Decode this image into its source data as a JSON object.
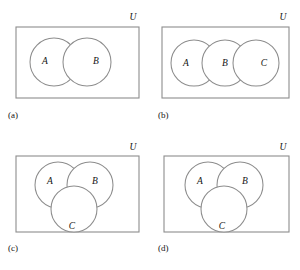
{
  "figure": {
    "background_color": "#ffffff",
    "stroke_color": "#8d8d8d",
    "shade_color": "#e7e5e3",
    "text_color": "#141414"
  },
  "panels": [
    {
      "id": "a",
      "caption": "(a)",
      "universe_label": "U",
      "layout": "two-circles",
      "sets": [
        "A",
        "B"
      ],
      "shaded_description": "A and B excluding their intersection (symmetric difference)",
      "labels": [
        {
          "text": "A",
          "x": 45,
          "y": 62
        },
        {
          "text": "B",
          "x": 96,
          "y": 62
        }
      ],
      "rect": {
        "x": 16,
        "y": 27,
        "width": 123,
        "height": 71
      },
      "circles": [
        {
          "set": "A",
          "cx": 54,
          "cy": 62,
          "r": 24
        },
        {
          "set": "B",
          "cx": 87,
          "cy": 62,
          "r": 24
        }
      ],
      "universe_label_pos": {
        "x": 133,
        "y": 18
      },
      "caption_pos": {
        "x": 8,
        "y": 116
      }
    },
    {
      "id": "b",
      "caption": "(b)",
      "universe_label": "U",
      "layout": "three-circles-row",
      "sets": [
        "A",
        "B",
        "C"
      ],
      "shaded_description": "(A intersect B) union (B intersect C)",
      "labels": [
        {
          "text": "A",
          "x": 36,
          "y": 64
        },
        {
          "text": "B",
          "x": 75,
          "y": 64
        },
        {
          "text": "C",
          "x": 114,
          "y": 64
        }
      ],
      "rect": {
        "x": 12,
        "y": 27,
        "width": 127,
        "height": 71
      },
      "circles": [
        {
          "set": "A",
          "cx": 44,
          "cy": 63,
          "r": 23
        },
        {
          "set": "B",
          "cx": 75,
          "cy": 63,
          "r": 23
        },
        {
          "set": "C",
          "cx": 106,
          "cy": 63,
          "r": 23
        }
      ],
      "universe_label_pos": {
        "x": 133,
        "y": 18
      },
      "caption_pos": {
        "x": 8,
        "y": 116
      }
    },
    {
      "id": "c",
      "caption": "(c)",
      "universe_label": "U",
      "layout": "three-circles-venn",
      "sets": [
        "A",
        "B",
        "C"
      ],
      "shaded_description": "A only (A minus B minus C)",
      "labels": [
        {
          "text": "A",
          "x": 50,
          "y": 47
        },
        {
          "text": "B",
          "x": 95,
          "y": 47
        },
        {
          "text": "C",
          "x": 72,
          "y": 92
        }
      ],
      "rect": {
        "x": 16,
        "y": 21,
        "width": 123,
        "height": 76
      },
      "circles": [
        {
          "set": "A",
          "cx": 58,
          "cy": 50,
          "r": 23
        },
        {
          "set": "B",
          "cx": 90,
          "cy": 50,
          "r": 23
        },
        {
          "set": "C",
          "cx": 74,
          "cy": 74,
          "r": 23
        }
      ],
      "universe_label_pos": {
        "x": 133,
        "y": 13
      },
      "caption_pos": {
        "x": 8,
        "y": 114
      }
    },
    {
      "id": "d",
      "caption": "(d)",
      "universe_label": "U",
      "layout": "three-circles-venn",
      "sets": [
        "A",
        "B",
        "C"
      ],
      "shaded_description": "A only union C only",
      "labels": [
        {
          "text": "A",
          "x": 50,
          "y": 47
        },
        {
          "text": "B",
          "x": 95,
          "y": 47
        },
        {
          "text": "C",
          "x": 72,
          "y": 92
        }
      ],
      "rect": {
        "x": 14,
        "y": 21,
        "width": 125,
        "height": 76
      },
      "circles": [
        {
          "set": "A",
          "cx": 58,
          "cy": 50,
          "r": 23
        },
        {
          "set": "B",
          "cx": 90,
          "cy": 50,
          "r": 23
        },
        {
          "set": "C",
          "cx": 74,
          "cy": 74,
          "r": 23
        }
      ],
      "universe_label_pos": {
        "x": 133,
        "y": 13
      },
      "caption_pos": {
        "x": 8,
        "y": 114
      }
    }
  ]
}
